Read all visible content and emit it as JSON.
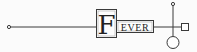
{
  "diagram": {
    "title_initial": "F",
    "title_rest": "EVER",
    "colors": {
      "stroke": "#3a3a3a",
      "text": "#222222",
      "background": "#fbfbfb"
    },
    "elements": [
      {
        "type": "terminal-dot",
        "position": "left"
      },
      {
        "type": "horizontal-line",
        "position": "left-to-title"
      },
      {
        "type": "title-box-initial",
        "text": "F"
      },
      {
        "type": "title-box-rest",
        "text": "EVER"
      },
      {
        "type": "horizontal-line",
        "position": "title-to-right"
      },
      {
        "type": "vertical-line",
        "position": "right-junction"
      },
      {
        "type": "terminal-dot",
        "position": "top"
      },
      {
        "type": "square-node",
        "position": "right"
      },
      {
        "type": "circle-node",
        "position": "bottom"
      }
    ]
  }
}
